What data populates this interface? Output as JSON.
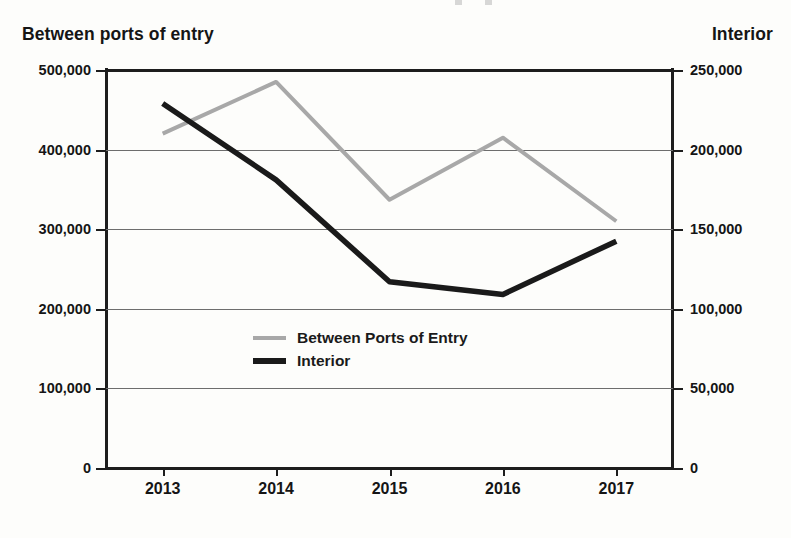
{
  "chart_data": {
    "type": "line",
    "title": "",
    "xlabel": "",
    "categories": [
      "2013",
      "2014",
      "2015",
      "2016",
      "2017"
    ],
    "grid": true,
    "legend_position": "center",
    "series": [
      {
        "name": "Between Ports of Entry",
        "axis": "left",
        "color": "#a8a8a8",
        "values": [
          420000,
          485000,
          337000,
          415000,
          310000
        ]
      },
      {
        "name": "Interior",
        "axis": "right",
        "color": "#1a1a1a",
        "values": [
          229000,
          181000,
          117000,
          109000,
          142500
        ]
      }
    ],
    "left_axis": {
      "title": "Between ports of entry",
      "ylim": [
        0,
        500000
      ],
      "ticks": [
        500000,
        400000,
        300000,
        200000,
        100000,
        0
      ],
      "tick_labels": [
        "500,000",
        "400,000",
        "300,000",
        "200,000",
        "100,000",
        "0"
      ]
    },
    "right_axis": {
      "title": "Interior",
      "ylim": [
        0,
        250000
      ],
      "ticks": [
        250000,
        200000,
        150000,
        100000,
        50000,
        0
      ],
      "tick_labels": [
        "250,000",
        "200,000",
        "150,000",
        "100,000",
        "50,000",
        "0"
      ]
    }
  },
  "axis_titles": {
    "left": "Between ports of entry",
    "right": "Interior"
  },
  "legend": {
    "items": [
      {
        "label": "Between Ports of Entry",
        "color": "#a8a8a8"
      },
      {
        "label": "Interior",
        "color": "#1a1a1a"
      }
    ]
  }
}
